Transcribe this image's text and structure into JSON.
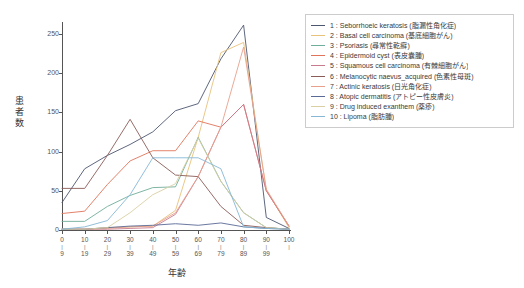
{
  "chart_data": {
    "type": "line",
    "title": "",
    "xlabel": "年齢",
    "ylabel": "患者数",
    "categories": [
      "0\n|\n9",
      "10\n|\n19",
      "20\n|\n29",
      "30\n|\n39",
      "40\n|\n49",
      "50\n|\n59",
      "60\n|\n69",
      "70\n|\n79",
      "80\n|\n89",
      "90\n|\n99",
      "100"
    ],
    "x_tick_upper": [
      "0",
      "10",
      "20",
      "30",
      "40",
      "50",
      "60",
      "70",
      "80",
      "90",
      "100"
    ],
    "x_tick_lower": [
      "9",
      "19",
      "29",
      "39",
      "49",
      "59",
      "69",
      "79",
      "89",
      "99",
      ""
    ],
    "x": [
      0,
      10,
      20,
      30,
      40,
      50,
      60,
      70,
      80,
      90,
      100
    ],
    "ylim": [
      0,
      265
    ],
    "xlim": [
      0,
      100
    ],
    "y_ticks": [
      0,
      50,
      100,
      150,
      200,
      250
    ],
    "grid": false,
    "legend_position": "right",
    "series": [
      {
        "name": "1 : Seborrhoeic keratosis (脂漏性角化症)",
        "color": "#4c566f",
        "values": [
          35,
          78,
          95,
          109,
          125,
          152,
          161,
          218,
          261,
          16,
          2
        ]
      },
      {
        "name": "2 : Basal cell carcinoma (基底細胞がん)",
        "color": "#e8c27a",
        "values": [
          1,
          1,
          3,
          4,
          5,
          25,
          118,
          226,
          239,
          51,
          3
        ]
      },
      {
        "name": "3 : Psoriasis (尋常性乾癬)",
        "color": "#6fae9a",
        "values": [
          11,
          11,
          30,
          44,
          54,
          55,
          118,
          62,
          22,
          3,
          1
        ]
      },
      {
        "name": "4 : Epidermoid cyst (表皮嚢腫)",
        "color": "#e0745a",
        "values": [
          21,
          24,
          58,
          88,
          101,
          101,
          139,
          131,
          160,
          50,
          5
        ]
      },
      {
        "name": "5 : Squamous cell carcinoma (有棘細胞がん)",
        "color": "#c97b8e",
        "values": [
          1,
          1,
          1,
          2,
          3,
          20,
          68,
          131,
          160,
          50,
          5
        ]
      },
      {
        "name": "6 : Melanocytic naevus_acquired (色素性母斑)",
        "color": "#8a5b57",
        "values": [
          53,
          53,
          95,
          141,
          92,
          70,
          68,
          30,
          6,
          3,
          1
        ]
      },
      {
        "name": "7 : Actinic keratosis (日光角化症)",
        "color": "#e8a08c",
        "values": [
          1,
          1,
          2,
          4,
          5,
          22,
          68,
          131,
          233,
          52,
          5
        ]
      },
      {
        "name": "8 : Atopic dermatitis (アトピー性皮膚炎)",
        "color": "#5a6a96",
        "values": [
          1,
          1,
          3,
          5,
          6,
          8,
          6,
          9,
          4,
          2,
          1
        ]
      },
      {
        "name": "9 : Drug induced exanthem (薬疹)",
        "color": "#d9cfa3",
        "values": [
          1,
          1,
          3,
          22,
          45,
          59,
          117,
          62,
          22,
          3,
          1
        ]
      },
      {
        "name": "10 : Lipoma (脂肪腫)",
        "color": "#86b8d6",
        "values": [
          1,
          4,
          12,
          45,
          92,
          92,
          92,
          78,
          4,
          2,
          1
        ]
      }
    ]
  }
}
